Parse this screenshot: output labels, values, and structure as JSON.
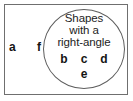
{
  "figure": {
    "type": "venn-diagram",
    "universal_set": {
      "name": "universal-set-rectangle",
      "border_color": "#6f6f6f"
    },
    "circle": {
      "name": "set-circle",
      "border_color": "#5d5d5d",
      "label_lines": [
        "Shapes",
        "with a",
        "right-angle"
      ],
      "label_text": "Shapes with a right-angle"
    },
    "members_inside": {
      "row_1": [
        "b",
        "c",
        "d"
      ],
      "row_2": [
        "e"
      ]
    },
    "members_outside": [
      "a",
      "f"
    ]
  },
  "chart_data": {
    "type": "table",
    "title": "Shapes with a right-angle",
    "categories": [
      "inside-circle",
      "outside-circle"
    ],
    "sets": [
      {
        "name": "Shapes with a right-angle",
        "members": [
          "b",
          "c",
          "d",
          "e"
        ]
      },
      {
        "name": "Outside (no right-angle)",
        "members": [
          "a",
          "f"
        ]
      }
    ]
  }
}
